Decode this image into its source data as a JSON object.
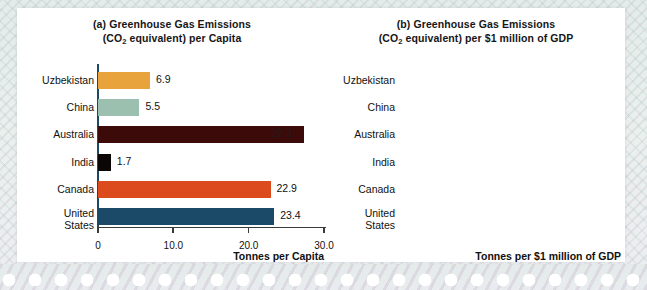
{
  "figure": {
    "background_color": "#e7eeea",
    "card_color": "#ffffff"
  },
  "chart_data": [
    {
      "type": "bar",
      "orientation": "horizontal",
      "panel": "(a)",
      "title_line1": "(a) Greenhouse Gas Emissions",
      "title_line2_pre": "(CO",
      "title_line2_sub": "2",
      "title_line2_post": " equivalent) per Capita",
      "categories": [
        "Uzbekistan",
        "China",
        "Australia",
        "India",
        "Canada",
        "United\nStates"
      ],
      "values": [
        6.9,
        5.5,
        27.3,
        1.7,
        22.9,
        23.4
      ],
      "value_labels": [
        "6.9",
        "5.5",
        "27.3",
        "1.7",
        "22.9",
        "23.4"
      ],
      "bar_colors": [
        "#e8a33c",
        "#9cc0b0",
        "#3d0a0a",
        "#0a0606",
        "#dc4b1e",
        "#1b4a68"
      ],
      "xlabel": "Tonnes per Capita",
      "ylabel": "",
      "xlim": [
        0,
        30
      ],
      "xticks": [
        0,
        10,
        20,
        30
      ],
      "xticklabels": [
        "0",
        "10.0",
        "20.0",
        "30.0"
      ],
      "grid": false,
      "legend": "none"
    },
    {
      "type": "bar",
      "orientation": "horizontal",
      "panel": "(b)",
      "title_line1": "(b) Greenhouse Gas Emissions",
      "title_line2_pre": "(CO",
      "title_line2_sub": "2",
      "title_line2_post": " equivalent) per $1 million of GDP",
      "categories": [
        "Uzbekistan",
        "China",
        "Australia",
        "India",
        "Canada",
        "United\nStates"
      ],
      "values": [
        3454,
        1361,
        800,
        760,
        654,
        559
      ],
      "value_labels": [
        "3,454",
        "1,361",
        "800",
        "760",
        "654",
        "559"
      ],
      "bar_colors": [
        "#e8a33c",
        "#9cc0b0",
        "#3d0a0a",
        "#0a0606",
        "#dc4b1e",
        "#1b4a68"
      ],
      "xlabel": "Tonnes per $1 million of GDP",
      "ylabel": "",
      "xlim": [
        0,
        3500
      ],
      "xticks": [
        0,
        500,
        1500,
        2500,
        3500
      ],
      "xticklabels": [
        "0",
        "500",
        "1,500",
        "2,500",
        "3,500"
      ],
      "grid": false,
      "legend": "none"
    }
  ]
}
